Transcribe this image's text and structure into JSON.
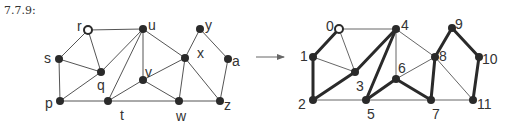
{
  "title": "7.7.9:",
  "colors": {
    "ink": "#2a2a2a",
    "thin": "#555555",
    "background": "#ffffff"
  },
  "left_graph": {
    "nodes": [
      {
        "id": "r",
        "x": 88,
        "y": 30,
        "open": true,
        "lx": -11,
        "ly": -3
      },
      {
        "id": "u",
        "x": 143,
        "y": 29,
        "open": false,
        "lx": 5,
        "ly": -3
      },
      {
        "id": "y",
        "x": 200,
        "y": 29,
        "open": false,
        "lx": 5,
        "ly": -3
      },
      {
        "id": "s",
        "x": 59,
        "y": 59,
        "open": false,
        "lx": -15,
        "ly": 0
      },
      {
        "id": "x",
        "x": 185,
        "y": 58,
        "open": false,
        "lx": 12,
        "ly": -4
      },
      {
        "id": "a",
        "x": 228,
        "y": 59,
        "open": false,
        "lx": 4,
        "ly": 3
      },
      {
        "id": "q",
        "x": 101,
        "y": 72,
        "open": false,
        "lx": -4,
        "ly": 14
      },
      {
        "id": "v",
        "x": 143,
        "y": 80,
        "open": false,
        "lx": 2,
        "ly": -7
      },
      {
        "id": "p",
        "x": 60,
        "y": 101,
        "open": false,
        "lx": -15,
        "ly": 3
      },
      {
        "id": "t",
        "x": 108,
        "y": 101,
        "open": false,
        "lx": 12,
        "ly": 15
      },
      {
        "id": "w",
        "x": 179,
        "y": 101,
        "open": false,
        "lx": -3,
        "ly": 16
      },
      {
        "id": "z",
        "x": 220,
        "y": 101,
        "open": false,
        "lx": 4,
        "ly": 5
      }
    ],
    "edges": [
      [
        "r",
        "u"
      ],
      [
        "r",
        "s"
      ],
      [
        "r",
        "q"
      ],
      [
        "s",
        "q"
      ],
      [
        "s",
        "p"
      ],
      [
        "p",
        "q"
      ],
      [
        "p",
        "t"
      ],
      [
        "q",
        "u"
      ],
      [
        "u",
        "t"
      ],
      [
        "u",
        "v"
      ],
      [
        "u",
        "x"
      ],
      [
        "v",
        "t"
      ],
      [
        "v",
        "w"
      ],
      [
        "t",
        "w"
      ],
      [
        "w",
        "z"
      ],
      [
        "x",
        "v"
      ],
      [
        "x",
        "w"
      ],
      [
        "x",
        "z"
      ],
      [
        "x",
        "y"
      ],
      [
        "y",
        "a"
      ],
      [
        "a",
        "z"
      ]
    ]
  },
  "arrow": {
    "x1": 256,
    "y1": 57,
    "x2": 284,
    "y2": 57
  },
  "right_graph": {
    "nodes": [
      {
        "id": "0",
        "x": 339,
        "y": 29,
        "open": true,
        "lx": -13,
        "ly": -2
      },
      {
        "id": "4",
        "x": 396,
        "y": 29,
        "open": false,
        "lx": 5,
        "ly": -3
      },
      {
        "id": "9",
        "x": 452,
        "y": 28,
        "open": false,
        "lx": 3,
        "ly": -3
      },
      {
        "id": "1",
        "x": 313,
        "y": 57,
        "open": false,
        "lx": -13,
        "ly": 0
      },
      {
        "id": "8",
        "x": 435,
        "y": 57,
        "open": false,
        "lx": 4,
        "ly": 0
      },
      {
        "id": "10",
        "x": 479,
        "y": 57,
        "open": false,
        "lx": 3,
        "ly": 3
      },
      {
        "id": "3",
        "x": 355,
        "y": 72,
        "open": false,
        "lx": 1,
        "ly": 15
      },
      {
        "id": "6",
        "x": 396,
        "y": 79,
        "open": false,
        "lx": 2,
        "ly": -10
      },
      {
        "id": "2",
        "x": 313,
        "y": 100,
        "open": false,
        "lx": -15,
        "ly": 5
      },
      {
        "id": "5",
        "x": 366,
        "y": 100,
        "open": false,
        "lx": 1,
        "ly": 15
      },
      {
        "id": "7",
        "x": 431,
        "y": 100,
        "open": false,
        "lx": 1,
        "ly": 15
      },
      {
        "id": "11",
        "x": 473,
        "y": 100,
        "open": false,
        "lx": 4,
        "ly": 5
      }
    ],
    "thick_edges": [
      [
        "0",
        "1"
      ],
      [
        "1",
        "2"
      ],
      [
        "2",
        "3"
      ],
      [
        "3",
        "4"
      ],
      [
        "4",
        "5"
      ],
      [
        "5",
        "6"
      ],
      [
        "6",
        "7"
      ],
      [
        "7",
        "8"
      ],
      [
        "8",
        "9"
      ],
      [
        "9",
        "10"
      ],
      [
        "10",
        "11"
      ]
    ],
    "thin_edges": [
      [
        "0",
        "4"
      ],
      [
        "0",
        "3"
      ],
      [
        "1",
        "3"
      ],
      [
        "2",
        "5"
      ],
      [
        "5",
        "7"
      ],
      [
        "7",
        "11"
      ],
      [
        "4",
        "6"
      ],
      [
        "4",
        "8"
      ],
      [
        "6",
        "8"
      ],
      [
        "8",
        "11"
      ]
    ]
  }
}
